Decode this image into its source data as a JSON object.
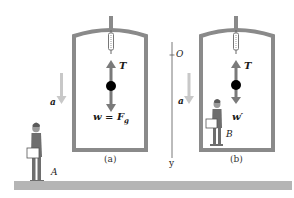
{
  "figure": {
    "panels": [
      {
        "id": "a",
        "caption": "(a)",
        "force_up_label": "T",
        "force_down_label": "w = F",
        "force_down_subscript": "g",
        "acceleration_label": "a",
        "observer_label": "A"
      },
      {
        "id": "b",
        "caption": "(b)",
        "force_up_label": "T",
        "force_down_label": "w′",
        "acceleration_label": "a",
        "observer_label": "B"
      }
    ],
    "axis": {
      "origin_label": "O",
      "axis_label": "y"
    },
    "colors": {
      "frame": "#8a8a8a",
      "force_arrow": "#7a7a7a",
      "accel_arrow": "#c8c8c8",
      "mass": "#000000",
      "ground": "#b5b5b5",
      "person": "#6e6e6e"
    }
  }
}
